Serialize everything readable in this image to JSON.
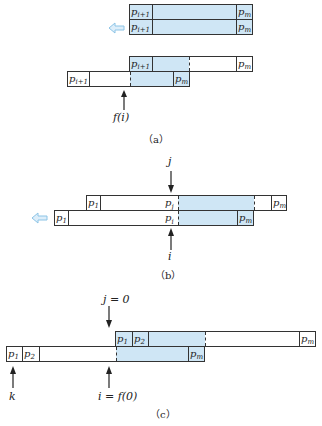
{
  "colors": {
    "shade": "#cfe6f5",
    "arrow_fill": "#ddeefa",
    "arrow_stroke": "#8cc4e6",
    "line": "#333333"
  },
  "panel_a": {
    "caption": "（a）",
    "top_pair": [
      {
        "left_cell": "p",
        "left_sub": "i+1",
        "right_cell": "p",
        "right_sub": "m"
      },
      {
        "left_cell": "p",
        "left_sub": "i+1",
        "right_cell": "p",
        "right_sub": "m"
      }
    ],
    "shift_arrow": "left-hollow-arrow",
    "bottom_pair": {
      "upper": {
        "left_cell": "p",
        "left_sub": "i+1",
        "right_cell": "p",
        "right_sub": "m"
      },
      "lower": {
        "left_cell": "p",
        "left_sub": "i+1",
        "right_cell": "p",
        "right_sub": "m"
      }
    },
    "pointer_label": "f(i)"
  },
  "panel_b": {
    "caption": "（b）",
    "upper": {
      "left_cell": "p",
      "left_sub": "1",
      "mid_cell": "p",
      "mid_sub": "j",
      "right_cell": "p",
      "right_sub": "m"
    },
    "lower": {
      "left_cell": "p",
      "left_sub": "1",
      "mid_cell": "p",
      "mid_sub": "i",
      "right_cell": "p",
      "right_sub": "m"
    },
    "top_pointer_label": "j",
    "bottom_pointer_label": "i",
    "shift_arrow": "left-hollow-arrow"
  },
  "panel_c": {
    "caption": "（c）",
    "upper": {
      "cell1": "p",
      "sub1": "1",
      "cell2": "p",
      "sub2": "2",
      "right_cell": "p",
      "right_sub": "m"
    },
    "lower": {
      "cell1": "p",
      "sub1": "1",
      "cell2": "p",
      "sub2": "2",
      "right_cell": "p",
      "right_sub": "m"
    },
    "top_pointer_label": "j = 0",
    "k_pointer_label": "k",
    "i_pointer_label": "i = f(0)"
  }
}
